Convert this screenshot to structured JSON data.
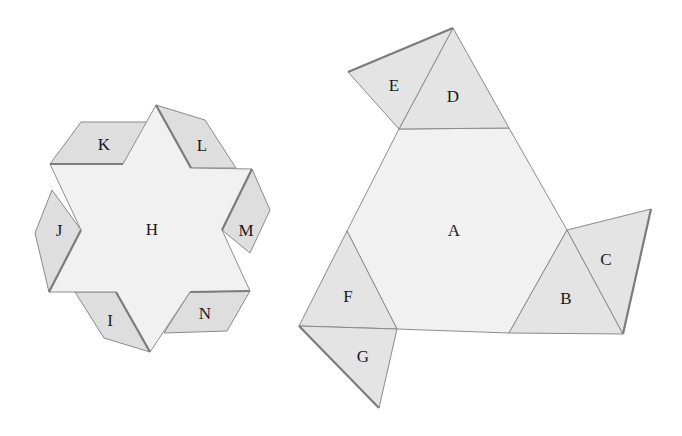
{
  "figure": {
    "left_net": {
      "center_label": "H",
      "flaps": [
        "K",
        "L",
        "M",
        "N",
        "I",
        "J"
      ]
    },
    "right_net": {
      "center_label": "A",
      "triangles": [
        "B",
        "C",
        "D",
        "E",
        "F",
        "G"
      ]
    }
  },
  "labels": {
    "A": "A",
    "B": "B",
    "C": "C",
    "D": "D",
    "E": "E",
    "F": "F",
    "G": "G",
    "H": "H",
    "I": "I",
    "J": "J",
    "K": "K",
    "L": "L",
    "M": "M",
    "N": "N"
  },
  "colors": {
    "face_light": "#f1f1f1",
    "face_shaded": "#dedede",
    "edge": "#8a8a8a",
    "text": "#1a1a1a"
  }
}
